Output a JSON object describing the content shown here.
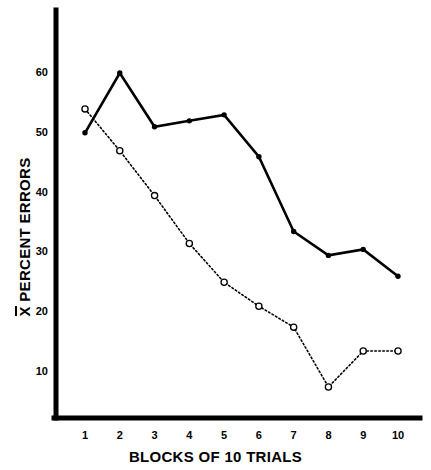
{
  "chart_data": {
    "type": "line",
    "title": "",
    "xlabel": "BLOCKS OF 10 TRIALS",
    "ylabel": "X̄ PERCENT ERRORS",
    "ylabel_prefix": "X",
    "ylabel_rest": " PERCENT ERRORS",
    "x": [
      1,
      2,
      3,
      4,
      5,
      6,
      7,
      8,
      9,
      10
    ],
    "categories": [
      "1",
      "2",
      "3",
      "4",
      "5",
      "6",
      "7",
      "8",
      "9",
      "10"
    ],
    "xtick_labels": [
      "1",
      "2",
      "3",
      "4",
      "5",
      "6",
      "7",
      "8",
      "9",
      "10"
    ],
    "ytick_labels": [
      "10",
      "20",
      "30",
      "40",
      "50",
      "60"
    ],
    "yticks": [
      10,
      20,
      30,
      40,
      50,
      60
    ],
    "xlim": [
      0.6,
      10.45
    ],
    "ylim": [
      0,
      68
    ],
    "grid": false,
    "legend": "none",
    "series": [
      {
        "name": "solid-filled-circles",
        "marker": "filled-circle",
        "linestyle": "solid",
        "color": "#000000",
        "values": [
          50,
          60,
          51,
          52,
          53,
          46,
          33.5,
          29.5,
          30.5,
          26
        ]
      },
      {
        "name": "dotted-open-circles",
        "marker": "open-circle",
        "linestyle": "dotted",
        "color": "#000000",
        "values": [
          54,
          47,
          39.5,
          31.5,
          25,
          21,
          17.5,
          7.5,
          13.5,
          13.5
        ]
      }
    ]
  },
  "axis": {
    "tick_labels_y": [
      "60",
      "50",
      "40",
      "30",
      "20",
      "10"
    ],
    "tick_labels_x": [
      "1",
      "2",
      "3",
      "4",
      "5",
      "6",
      "7",
      "8",
      "9",
      "10"
    ]
  },
  "colors": {
    "ink": "#000000",
    "background": "#ffffff"
  }
}
